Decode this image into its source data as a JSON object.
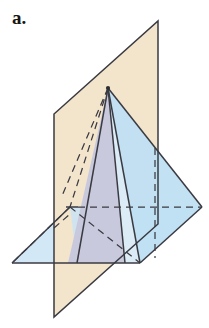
{
  "figure": {
    "label": "a.",
    "caption_text": "a.",
    "background_color": "#ffffff",
    "canvas": {
      "width": 209,
      "height": 328
    },
    "colors": {
      "cutting_plane_fill": "#f3e4ca",
      "base_plane_fill": "#c9e4f4",
      "pyramid_right_face_fill": "#bfdff2",
      "cross_section_fill": "#c9c9dd",
      "pyramid_front_left_face_fill": "#dcecf7",
      "outline": "#3a3a42",
      "hidden_edge": "#3a3a42",
      "label_color": "#161616"
    },
    "points": {
      "apex": {
        "x": 108,
        "y": 88
      },
      "base_front": {
        "x": 77,
        "y": 263
      },
      "base_right": {
        "x": 140,
        "y": 263
      },
      "base_back": {
        "x": 70,
        "y": 207
      },
      "base_left": {
        "x": 12,
        "y": 263
      },
      "base_far_right": {
        "x": 202,
        "y": 207
      },
      "plane_top_right": {
        "x": 158,
        "y": 21
      },
      "plane_top_left": {
        "x": 54,
        "y": 114
      },
      "plane_bottom_left": {
        "x": 54,
        "y": 317
      },
      "plane_bottom_right": {
        "x": 158,
        "y": 224
      },
      "cross_left": {
        "x": 77,
        "y": 263
      },
      "cross_right": {
        "x": 125,
        "y": 263
      }
    },
    "elements": {
      "cutting_plane_name": "cutting-plane",
      "base_plane_name": "base-plane",
      "pyramid_name": "square-pyramid",
      "cross_section_name": "triangular-cross-section",
      "hidden_edges_name": "hidden-edges"
    }
  }
}
